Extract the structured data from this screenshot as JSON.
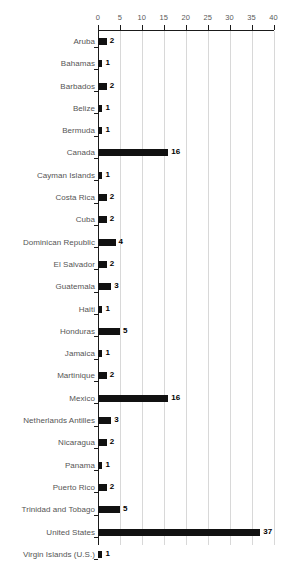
{
  "chart_data": {
    "type": "bar",
    "orientation": "horizontal",
    "title": "",
    "xlabel": "",
    "ylabel": "",
    "xlim": [
      0,
      40
    ],
    "xticks": [
      0,
      5,
      10,
      15,
      20,
      25,
      30,
      35,
      40
    ],
    "grid": true,
    "legend": "none",
    "bar_color": "#111111",
    "label_color": "#555555",
    "gridline_color": "#d8d8d8",
    "axis_color": "#1a1a1a",
    "categories": [
      "Aruba",
      "Bahamas",
      "Barbados",
      "Belize",
      "Bermuda",
      "Canada",
      "Cayman Islands",
      "Costa Rica",
      "Cuba",
      "Dominican Republic",
      "El Salvador",
      "Guatemala",
      "Haiti",
      "Honduras",
      "Jamaica",
      "Martinique",
      "Mexico",
      "Netherlands Antilles",
      "Nicaragua",
      "Panama",
      "Puerto Rico",
      "Trinidad and Tobago",
      "United States",
      "Virgin Islands (U.S.)"
    ],
    "values": [
      2,
      1,
      2,
      1,
      1,
      16,
      1,
      2,
      2,
      4,
      2,
      3,
      1,
      5,
      1,
      2,
      16,
      3,
      2,
      1,
      2,
      5,
      37,
      1
    ],
    "value_labels": [
      "2",
      "1",
      "2",
      "1",
      "1",
      "16",
      "1",
      "2",
      "2",
      "4",
      "2",
      "3",
      "1",
      "5",
      "1",
      "2",
      "16",
      "3",
      "2",
      "1",
      "2",
      "5",
      "37",
      "1"
    ],
    "tick_labels": [
      "0",
      "5",
      "10",
      "15",
      "20",
      "25",
      "30",
      "35",
      "40"
    ]
  }
}
